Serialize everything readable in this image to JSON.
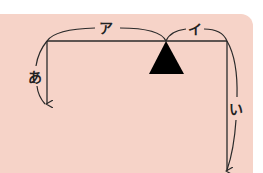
{
  "diagram": {
    "type": "lever-balance",
    "background_color": "#f6d3c8",
    "line_color": "#2a2a2a",
    "fulcrum_color": "#000000",
    "labels": {
      "arm_left": "ア",
      "arm_right": "イ",
      "force_left": "あ",
      "force_right": "い"
    }
  }
}
